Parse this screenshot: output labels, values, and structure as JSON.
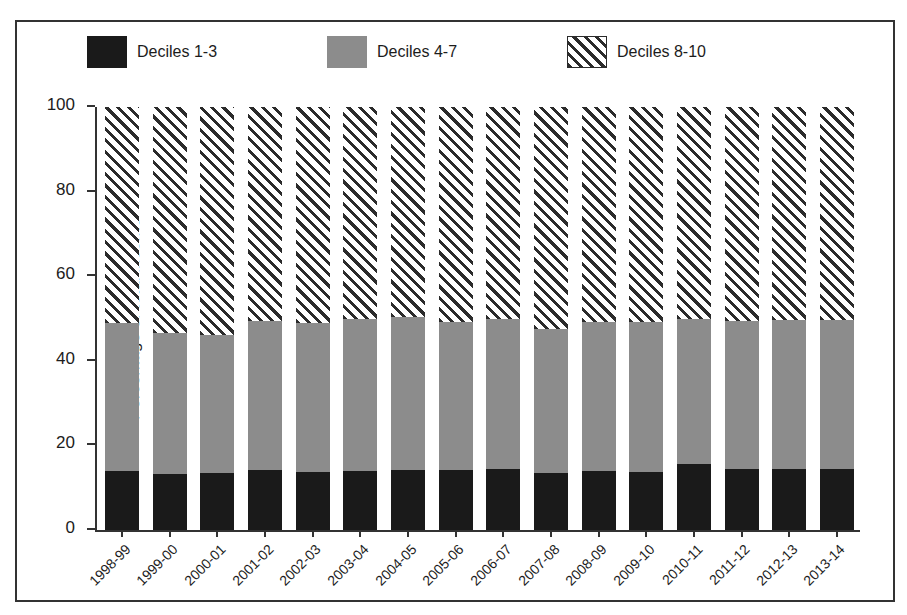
{
  "chart_data": {
    "type": "bar",
    "subtype": "stacked-100-percent",
    "title": "",
    "xlabel": "",
    "ylabel": "Percentage of total income",
    "ylim": [
      0,
      100
    ],
    "yticks": [
      0,
      20,
      40,
      60,
      80,
      100
    ],
    "grid": false,
    "legend_position": "top",
    "categories": [
      "1998-99",
      "1999-00",
      "2000-01",
      "2001-02",
      "2002-03",
      "2003-04",
      "2004-05",
      "2005-06",
      "2006-07",
      "2007-08",
      "2008-09",
      "2009-10",
      "2010-11",
      "2011-12",
      "2012-13",
      "2013-14"
    ],
    "series": [
      {
        "name": "Deciles 1-3",
        "style": "solid-black",
        "color": "#1a1a1a",
        "values": [
          14.0,
          13.3,
          13.4,
          14.1,
          13.6,
          14.0,
          14.2,
          14.2,
          14.5,
          13.5,
          13.9,
          13.8,
          15.5,
          14.4,
          14.5,
          14.4
        ]
      },
      {
        "name": "Deciles 4-7",
        "style": "solid-grey",
        "color": "#8c8c8c",
        "values": [
          35.0,
          33.2,
          32.6,
          35.4,
          35.3,
          35.9,
          36.1,
          35.0,
          35.4,
          34.0,
          35.3,
          35.4,
          34.3,
          35.1,
          35.2,
          35.3
        ]
      },
      {
        "name": "Deciles 8-10",
        "style": "diagonal-hatch",
        "color": "#2b2b2b",
        "values": [
          51.0,
          53.5,
          54.0,
          50.5,
          51.1,
          50.1,
          49.7,
          50.8,
          50.1,
          52.5,
          50.8,
          50.8,
          50.2,
          50.5,
          50.3,
          50.3
        ]
      }
    ],
    "stack_tops": {
      "deciles_1_3": [
        14.0,
        13.3,
        13.4,
        14.1,
        13.6,
        14.0,
        14.2,
        14.2,
        14.5,
        13.5,
        13.9,
        13.8,
        15.5,
        14.4,
        14.5,
        14.4
      ],
      "deciles_1_7": [
        49.0,
        46.5,
        46.0,
        49.5,
        48.9,
        49.9,
        50.3,
        49.2,
        49.9,
        47.5,
        49.2,
        49.2,
        49.8,
        49.5,
        49.7,
        49.7
      ],
      "total": [
        100,
        100,
        100,
        100,
        100,
        100,
        100,
        100,
        100,
        100,
        100,
        100,
        100,
        100,
        100,
        100
      ]
    }
  },
  "legend": {
    "entries": [
      {
        "label": "Deciles 1-3",
        "swatch": "dark"
      },
      {
        "label": "Deciles 4-7",
        "swatch": "grey"
      },
      {
        "label": "Deciles 8-10",
        "swatch": "hatch"
      }
    ]
  }
}
